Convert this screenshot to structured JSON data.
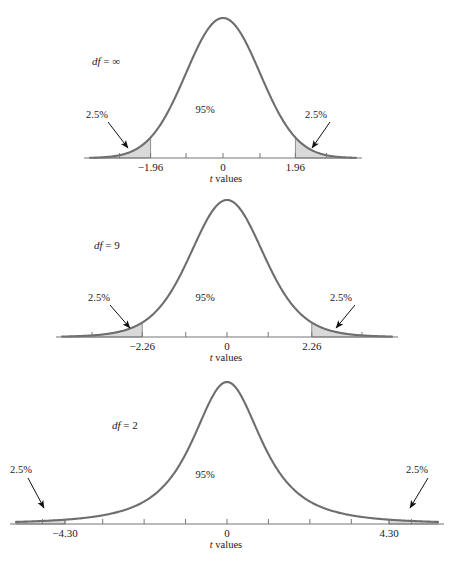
{
  "figure": {
    "title": "",
    "axis_title": "t values",
    "axis_title_italic_part": "t",
    "axis_title_rest": " values",
    "colors": {
      "curve": "#6e6e6e",
      "shade_fill": "#d9d9d9",
      "shade_stroke": "#7a7a7a",
      "axis": "#777777",
      "arrow": "#111111",
      "text": "#1a1a1a",
      "background": "#ffffff"
    }
  },
  "chart_data": {
    "type": "line",
    "xlabel": "t values",
    "ylabel": "",
    "grid": false,
    "legend": null,
    "panels": [
      {
        "id": "panel-df-infinity",
        "df_label": "df = ∞",
        "df_symbol": "df",
        "df_value": "∞",
        "df_numeric": 100000,
        "central_area_label": "95%",
        "central_area": 95,
        "left_tail_label": "2.5%",
        "right_tail_label": "2.5%",
        "tail_area": 2.5,
        "critical_values": [
          -1.96,
          1.96
        ],
        "tick_labels": [
          "−1.96",
          "0",
          "1.96"
        ],
        "tick_positions_t": [
          -1.96,
          0,
          1.96
        ],
        "axis_range_t": [
          -3.6,
          3.6
        ],
        "tick_marks_t": [
          -2.8,
          -1.96,
          -1.0,
          0,
          1.0,
          1.96,
          2.8
        ],
        "peak_height_px": 140
      },
      {
        "id": "panel-df-9",
        "df_label": "df = 9",
        "df_symbol": "df",
        "df_value": "9",
        "df_numeric": 9,
        "central_area_label": "95%",
        "central_area": 95,
        "left_tail_label": "2.5%",
        "right_tail_label": "2.5%",
        "tail_area": 2.5,
        "critical_values": [
          -2.26,
          2.26
        ],
        "tick_labels": [
          "−2.26",
          "0",
          "2.26"
        ],
        "tick_positions_t": [
          -2.26,
          0,
          2.26
        ],
        "axis_range_t": [
          -4.4,
          4.4
        ],
        "tick_marks_t": [
          -3.6,
          -2.26,
          -1.1,
          0,
          1.1,
          2.26,
          3.6
        ],
        "peak_height_px": 140
      },
      {
        "id": "panel-df-2",
        "df_label": "df = 2",
        "df_symbol": "df",
        "df_value": "2",
        "df_numeric": 2,
        "central_area_label": "95%",
        "central_area": 95,
        "left_tail_label": "2.5%",
        "right_tail_label": "2.5%",
        "tail_area": 2.5,
        "critical_values": [
          -4.3,
          4.3
        ],
        "tick_labels": [
          "−4.30",
          "0",
          "4.30"
        ],
        "tick_positions_t": [
          -4.3,
          0,
          4.3
        ],
        "axis_range_t": [
          -5.6,
          5.6
        ],
        "tick_marks_t": [
          -4.9,
          -4.3,
          -3.3,
          -2.2,
          -1.1,
          0,
          1.1,
          2.2,
          3.3,
          4.3,
          4.9
        ],
        "peak_height_px": 140
      }
    ]
  }
}
